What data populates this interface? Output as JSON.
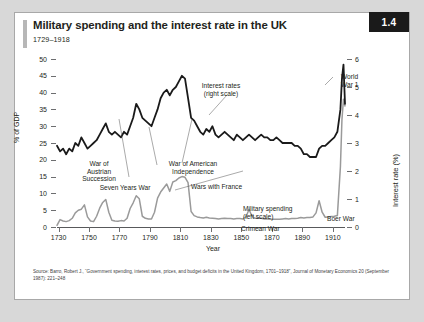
{
  "figure": {
    "number": "1.4",
    "title": "Military spending and the interest rate in the UK",
    "subtitle": "1729–1918",
    "source_line1": "Source: Barro, Robert J., “Government spending, interest rates, prices, and budget deficits in the United Kingdom, 1701–1918”, Journal of Monetary Economics",
    "source_line2": "20 (September 1987): 221–248"
  },
  "colors": {
    "interest_rate": "#1a1a1a",
    "military_spending": "#9a9a9a",
    "axis": "#58595b",
    "badge_bg": "#1a1a1a",
    "accent_bar": "#b7b7b7"
  },
  "chart_data": {
    "type": "line",
    "title": "Military spending and the interest rate in the UK",
    "subtitle": "1729–1918",
    "xlabel": "Year",
    "ylabel": "% of GDP",
    "y2label": "Interest rate (%)",
    "xlim": [
      1729,
      1918
    ],
    "ylim": [
      0,
      50
    ],
    "y2lim": [
      0,
      6
    ],
    "grid": false,
    "legend": "annotations",
    "xticks": [
      1730,
      1750,
      1770,
      1790,
      1810,
      1830,
      1850,
      1870,
      1890,
      1910
    ],
    "yticks": [
      0,
      5,
      10,
      15,
      20,
      25,
      30,
      35,
      40,
      45,
      50
    ],
    "y2ticks": [
      0,
      1,
      2,
      3,
      4,
      5,
      6
    ],
    "annotations": [
      {
        "label": "Interest rates\n(right scale)",
        "x": 1812,
        "y": 44
      },
      {
        "label": "War of\nAustrian\nSuccession",
        "x": 1746,
        "y": 19
      },
      {
        "label": "Seven Years War",
        "x": 1760,
        "y": 14
      },
      {
        "label": "War of American\nIndependence",
        "x": 1787,
        "y": 19
      },
      {
        "label": "Wars with France",
        "x": 1805,
        "y": 15
      },
      {
        "label": "Military spending\n(left scale)",
        "x": 1852,
        "y": 12
      },
      {
        "label": "Crimean War",
        "x": 1853,
        "y": 7
      },
      {
        "label": "Boer War",
        "x": 1896,
        "y": 8
      },
      {
        "label": "World\nWar 1",
        "x": 1906,
        "y": 46
      }
    ],
    "series": [
      {
        "name": "Interest rates (right scale)",
        "axis": "right",
        "color": "#1a1a1a",
        "unit": "%",
        "x": [
          1729,
          1731,
          1733,
          1735,
          1737,
          1739,
          1741,
          1743,
          1745,
          1747,
          1749,
          1751,
          1753,
          1755,
          1757,
          1759,
          1761,
          1763,
          1765,
          1767,
          1769,
          1771,
          1773,
          1775,
          1777,
          1779,
          1781,
          1783,
          1785,
          1787,
          1789,
          1791,
          1793,
          1795,
          1797,
          1799,
          1801,
          1803,
          1805,
          1807,
          1809,
          1811,
          1813,
          1815,
          1817,
          1819,
          1821,
          1823,
          1825,
          1827,
          1829,
          1831,
          1833,
          1835,
          1837,
          1839,
          1841,
          1843,
          1845,
          1847,
          1849,
          1851,
          1853,
          1855,
          1857,
          1859,
          1861,
          1863,
          1865,
          1867,
          1869,
          1871,
          1873,
          1875,
          1877,
          1879,
          1881,
          1883,
          1885,
          1887,
          1889,
          1891,
          1893,
          1895,
          1897,
          1899,
          1901,
          1903,
          1905,
          1907,
          1909,
          1911,
          1913,
          1915,
          1916,
          1917,
          1918
        ],
        "values": [
          2.9,
          2.7,
          2.8,
          2.6,
          2.8,
          2.7,
          3.0,
          2.9,
          3.2,
          3.0,
          2.8,
          2.9,
          3.0,
          3.1,
          3.3,
          3.5,
          3.7,
          3.4,
          3.3,
          3.4,
          3.3,
          3.2,
          3.4,
          3.3,
          3.6,
          3.9,
          4.4,
          4.2,
          3.9,
          3.8,
          3.7,
          3.6,
          3.9,
          4.2,
          4.6,
          4.8,
          4.9,
          4.7,
          4.9,
          5.0,
          5.2,
          5.4,
          5.3,
          4.6,
          3.9,
          3.8,
          3.6,
          3.4,
          3.3,
          3.5,
          3.4,
          3.6,
          3.3,
          3.2,
          3.3,
          3.4,
          3.3,
          3.2,
          3.1,
          3.3,
          3.2,
          3.1,
          3.2,
          3.3,
          3.2,
          3.1,
          3.2,
          3.3,
          3.2,
          3.2,
          3.1,
          3.1,
          3.2,
          3.1,
          3.0,
          3.0,
          3.0,
          3.0,
          2.9,
          2.9,
          2.8,
          2.6,
          2.6,
          2.5,
          2.5,
          2.5,
          2.8,
          2.9,
          2.9,
          3.0,
          3.1,
          3.2,
          3.4,
          4.2,
          5.3,
          5.8,
          4.4
        ]
      },
      {
        "name": "Military spending (left scale)",
        "axis": "left",
        "color": "#9a9a9a",
        "unit": "% of GDP",
        "x": [
          1729,
          1731,
          1733,
          1735,
          1737,
          1739,
          1741,
          1743,
          1745,
          1747,
          1749,
          1751,
          1753,
          1755,
          1757,
          1759,
          1761,
          1763,
          1765,
          1767,
          1769,
          1771,
          1773,
          1775,
          1777,
          1779,
          1781,
          1783,
          1785,
          1787,
          1789,
          1791,
          1793,
          1795,
          1797,
          1799,
          1801,
          1803,
          1805,
          1807,
          1809,
          1811,
          1813,
          1815,
          1817,
          1819,
          1821,
          1823,
          1825,
          1827,
          1829,
          1831,
          1833,
          1835,
          1837,
          1839,
          1841,
          1843,
          1845,
          1847,
          1849,
          1851,
          1853,
          1855,
          1857,
          1859,
          1861,
          1863,
          1865,
          1867,
          1869,
          1871,
          1873,
          1875,
          1877,
          1879,
          1881,
          1883,
          1885,
          1887,
          1889,
          1891,
          1893,
          1895,
          1897,
          1899,
          1901,
          1903,
          1905,
          1907,
          1909,
          1911,
          1913,
          1915,
          1916,
          1917,
          1918
        ],
        "values": [
          0.5,
          2.2,
          1.8,
          1.6,
          1.9,
          2.6,
          4.2,
          5.0,
          5.3,
          6.6,
          3.0,
          1.8,
          1.6,
          3.2,
          5.6,
          7.3,
          8.2,
          4.4,
          2.0,
          1.8,
          1.7,
          1.9,
          1.8,
          2.6,
          5.5,
          7.2,
          9.3,
          8.4,
          3.2,
          2.6,
          2.4,
          2.4,
          4.4,
          8.6,
          10.4,
          11.6,
          12.8,
          10.6,
          13.4,
          13.8,
          14.6,
          15.0,
          14.8,
          13.2,
          4.6,
          3.4,
          3.0,
          2.8,
          2.7,
          2.9,
          2.7,
          2.6,
          2.5,
          2.4,
          2.5,
          2.6,
          2.5,
          2.5,
          2.4,
          2.5,
          2.5,
          2.4,
          3.0,
          5.2,
          3.2,
          2.6,
          2.7,
          2.6,
          2.4,
          2.4,
          2.3,
          2.3,
          2.3,
          2.3,
          2.4,
          2.5,
          2.4,
          2.5,
          2.5,
          2.6,
          2.8,
          2.7,
          2.8,
          2.8,
          3.0,
          4.2,
          7.8,
          4.4,
          2.9,
          3.0,
          3.1,
          3.2,
          3.4,
          18.0,
          32.0,
          38.0,
          36.0
        ]
      }
    ]
  }
}
